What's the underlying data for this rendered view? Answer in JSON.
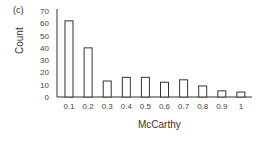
{
  "panel_label": "(c)",
  "chart_data": {
    "type": "bar",
    "title": "",
    "xlabel": "McCarthy",
    "ylabel": "Count",
    "categories": [
      "0.1",
      "0.2",
      "0.3",
      "0.4",
      "0.5",
      "0.6",
      "0.7",
      "0.8",
      "0.9",
      "1"
    ],
    "values": [
      62,
      40,
      13,
      16,
      16,
      12,
      14,
      9,
      5,
      4
    ],
    "yticks": [
      "0",
      "10",
      "20",
      "30",
      "40",
      "50",
      "60",
      "70"
    ],
    "ylim": [
      0,
      70
    ],
    "grid": false,
    "legend": null,
    "bar_style": {
      "fill": "#ffffff",
      "stroke": "#333333"
    }
  }
}
